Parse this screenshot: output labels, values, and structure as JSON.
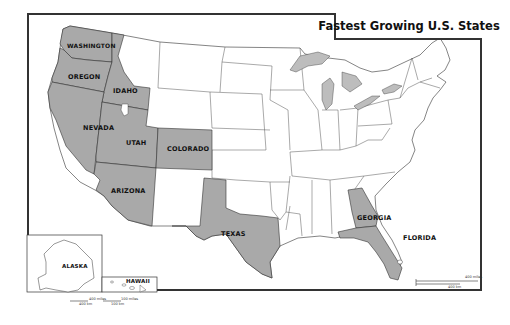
{
  "title": "Fastest Growing U.S. States",
  "colors": {
    "highlight_fill": "#a9a9a9",
    "default_fill": "#ffffff",
    "water_fill": "#bdbdbd",
    "border": "#333333",
    "frame": "#333333"
  },
  "highlighted_states": [
    {
      "id": "washington",
      "label": "WASHINGTON"
    },
    {
      "id": "oregon",
      "label": "OREGON"
    },
    {
      "id": "idaho",
      "label": "IDAHO"
    },
    {
      "id": "nevada",
      "label": "NEVADA"
    },
    {
      "id": "utah",
      "label": "UTAH"
    },
    {
      "id": "colorado",
      "label": "COLORADO"
    },
    {
      "id": "arizona",
      "label": "ARIZONA"
    },
    {
      "id": "texas",
      "label": "TEXAS"
    },
    {
      "id": "georgia",
      "label": "GEORGIA"
    },
    {
      "id": "florida",
      "label": "FLORIDA"
    }
  ],
  "insets": {
    "alaska": {
      "label": "ALASKA"
    },
    "hawaii": {
      "label": "HAWAII"
    }
  },
  "scale_bar": {
    "miles": "400 miles",
    "km": "400 km"
  },
  "inset_scales": {
    "alaska": {
      "miles": "400 miles",
      "km": "400 km"
    },
    "hawaii": {
      "miles": "100 miles",
      "km": "100 km"
    }
  }
}
